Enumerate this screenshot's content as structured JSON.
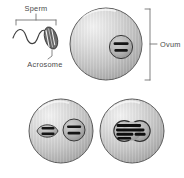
{
  "figure": {
    "background_color": "#ffffff",
    "ink_color": "#4a4a4a",
    "cell_fill_light": "#e8e8e8",
    "cell_fill_mid": "#c9c9c9",
    "cell_fill_dark": "#a8a8a8",
    "cell_outline": "#5a5a5a",
    "chromosome_color": "#1a1a1a",
    "nucleus_fill": "#b0b0b0",
    "sperm_head_fill": "#6e6e6e"
  },
  "labels": {
    "sperm": "Sperm",
    "acrosome": "Acrosome",
    "ovum": "Ovum"
  },
  "panels": [
    {
      "id": "panel-top",
      "name": "sperm-approaching-ovum",
      "stage": 1,
      "description": "Sperm with flagellar tail and acrosome-capped head contacts the ovum; ovum nucleus holds chromosomes",
      "structures": [
        "sperm-tail",
        "sperm-head",
        "acrosome",
        "ovum-cell",
        "ovum-nucleus",
        "ovum-chromosomes"
      ],
      "chromosome_bars": 2
    },
    {
      "id": "panel-bottom-left",
      "name": "sperm-nucleus-inside-ovum",
      "stage": 2,
      "description": "Sperm nucleus has entered the ovum cytoplasm and lies beside the ovum nucleus; two separate pronuclei",
      "structures": [
        "ovum-cell",
        "sperm-pronucleus",
        "sperm-chromosomes",
        "ovum-pronucleus",
        "ovum-chromosomes"
      ],
      "chromosome_bars": 4
    },
    {
      "id": "panel-bottom-right",
      "name": "fused-zygote-nucleus",
      "stage": 3,
      "description": "The two pronuclei have fused into a single zygote nucleus containing the combined chromosomes",
      "structures": [
        "ovum-cell",
        "fused-nucleus",
        "combined-chromosomes"
      ],
      "chromosome_bars": 4
    }
  ]
}
